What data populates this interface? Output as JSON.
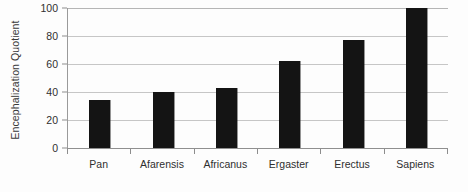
{
  "chart_data": {
    "type": "bar",
    "title": "",
    "xlabel": "",
    "ylabel": "Encephalization Quotient",
    "categories": [
      "Pan",
      "Afarensis",
      "Africanus",
      "Ergaster",
      "Erectus",
      "Sapiens"
    ],
    "values": [
      34,
      40,
      43,
      62,
      77,
      100
    ],
    "ylim": [
      0,
      100
    ],
    "yticks": [
      0,
      20,
      40,
      60,
      80,
      100
    ],
    "ytick_labels": [
      "0",
      "20",
      "40",
      "60",
      "80",
      "100"
    ],
    "grid": true,
    "legend": false,
    "bar_color": "#141414",
    "gridline_color": "#c6c6c6",
    "axis_color": "#8f8f8f",
    "background_color": "#fdfdfd",
    "series": [
      {
        "name": "Encephalization Quotient",
        "values": [
          34,
          40,
          43,
          62,
          77,
          100
        ]
      }
    ]
  }
}
